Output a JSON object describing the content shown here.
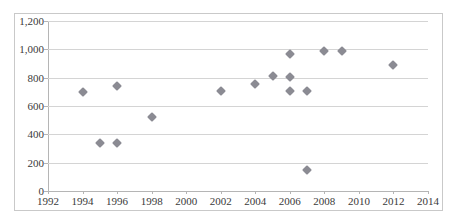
{
  "chart_data": {
    "type": "scatter",
    "title": "",
    "xlabel": "",
    "ylabel": "",
    "xlim": [
      1992,
      2014
    ],
    "ylim": [
      0,
      1200
    ],
    "xticks": [
      1992,
      1994,
      1996,
      1998,
      2000,
      2002,
      2004,
      2006,
      2008,
      2010,
      2012,
      2014
    ],
    "xtick_labels": [
      "1992",
      "1994",
      "1996",
      "1998",
      "2000",
      "2002",
      "2004",
      "2006",
      "2008",
      "2010",
      "2012",
      "2014"
    ],
    "yticks": [
      0,
      200,
      400,
      600,
      800,
      1000,
      1200
    ],
    "ytick_labels": [
      "0",
      "200",
      "400",
      "600",
      "800",
      "1,000",
      "1,200"
    ],
    "grid": "horizontal",
    "legend": "none",
    "marker_shape": "diamond",
    "marker_color": "#8b8b93",
    "gridline_color": "#d4d4d4",
    "axis_color": "#b5b5b5",
    "border_color": "#c9c9c9",
    "background_color": "#ffffff",
    "points": [
      {
        "x": 1994,
        "y": 700
      },
      {
        "x": 1995,
        "y": 340
      },
      {
        "x": 1996,
        "y": 740
      },
      {
        "x": 1996,
        "y": 340
      },
      {
        "x": 1998,
        "y": 525
      },
      {
        "x": 2002,
        "y": 705
      },
      {
        "x": 2004,
        "y": 755
      },
      {
        "x": 2005,
        "y": 815
      },
      {
        "x": 2006,
        "y": 970
      },
      {
        "x": 2006,
        "y": 808
      },
      {
        "x": 2006,
        "y": 705
      },
      {
        "x": 2007,
        "y": 705
      },
      {
        "x": 2007,
        "y": 150
      },
      {
        "x": 2008,
        "y": 985
      },
      {
        "x": 2009,
        "y": 985
      },
      {
        "x": 2012,
        "y": 890
      }
    ]
  }
}
